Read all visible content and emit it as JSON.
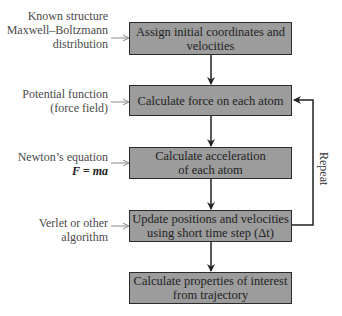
{
  "diagram": {
    "boxes": [
      {
        "line1": "Assign initial coordinates and",
        "line2": "velocities"
      },
      {
        "line1": "Calculate force on each atom",
        "line2": ""
      },
      {
        "line1": "Calculate acceleration",
        "line2": "of each atom"
      },
      {
        "line1": "Update positions and velocities",
        "line2": "using short time step (Δt)"
      },
      {
        "line1": "Calculate properties of interest",
        "line2": "from trajectory"
      }
    ],
    "inputs": [
      {
        "line1": "Known structure",
        "line2": "Maxwell–Boltzmann",
        "line3": "distribution"
      },
      {
        "line1": "Potential function",
        "line2": "(force field)"
      },
      {
        "line1": "Newton’s equation",
        "line2": "F = ma"
      },
      {
        "line1": "Verlet or other",
        "line2": "algorithm"
      }
    ],
    "loop_label": "Repeat",
    "colors": {
      "box_fill": "#9c9c9c",
      "box_border": "#2b2b2b",
      "input_arrow": "#8a8a8a"
    }
  }
}
